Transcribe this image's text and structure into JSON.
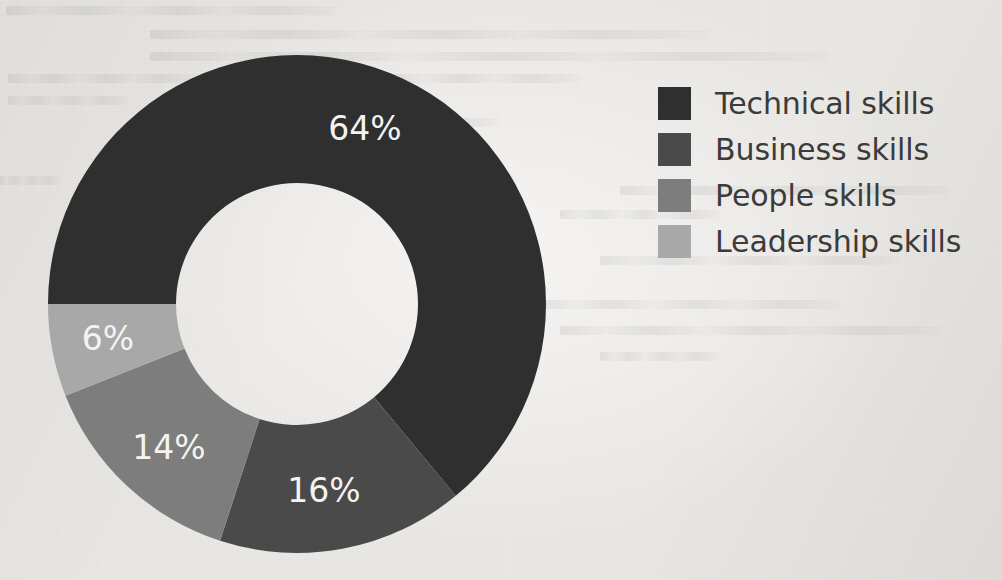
{
  "page": {
    "background_color": "#eceae7",
    "label_text_color": "#f4f3f1",
    "legend_text_color": "#3b3b3b"
  },
  "chart_data": {
    "type": "pie",
    "variant": "donut",
    "title": "",
    "subtitle": "",
    "xlabel": "",
    "ylabel": "",
    "legend_position": "right",
    "grid": false,
    "start_angle_deg": 270,
    "direction": "clockwise",
    "center": {
      "x": 297,
      "y": 304
    },
    "outer_radius": 249,
    "inner_radius": 121,
    "categories": [
      "Technical skills",
      "Business skills",
      "People skills",
      "Leadership skills"
    ],
    "values": [
      64,
      16,
      14,
      6
    ],
    "value_unit": "%",
    "colors": [
      "#2f2f2f",
      "#4a4a4a",
      "#7d7d7d",
      "#a8a8a8"
    ],
    "slices": [
      {
        "label": "Technical skills",
        "value": 64,
        "value_label": "64%",
        "color": "#2f2f2f",
        "start_angle_deg": 270,
        "sweep_deg": 230.4,
        "label_x": 365,
        "label_y": 130
      },
      {
        "label": "Business skills",
        "value": 16,
        "value_label": "16%",
        "color": "#4a4a4a",
        "start_angle_deg": 140.4,
        "sweep_deg": 57.6,
        "label_x": 324,
        "label_y": 492
      },
      {
        "label": "People skills",
        "value": 14,
        "value_label": "14%",
        "color": "#7d7d7d",
        "start_angle_deg": 198.0,
        "sweep_deg": 50.4,
        "label_x": 169,
        "label_y": 449
      },
      {
        "label": "Leadership skills",
        "value": 6,
        "value_label": "6%",
        "color": "#a8a8a8",
        "start_angle_deg": 248.4,
        "sweep_deg": 21.6,
        "label_x": 108,
        "label_y": 340
      }
    ]
  },
  "legend": {
    "items": [
      {
        "label": "Technical skills",
        "color": "#2f2f2f"
      },
      {
        "label": "Business skills",
        "color": "#4a4a4a"
      },
      {
        "label": "People skills",
        "color": "#7d7d7d"
      },
      {
        "label": "Leadership skills",
        "color": "#a8a8a8"
      }
    ]
  }
}
